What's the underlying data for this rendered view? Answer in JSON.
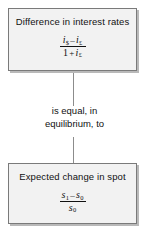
{
  "diagram": {
    "type": "flow-diagram",
    "background_color": "#ffffff",
    "box_fill_color": "#f2f2f2",
    "box_border_color": "#7a7a7a",
    "box_shadow_color": "#b9b9b9",
    "connector_color": "#8c8c8c",
    "text_color": "#111111"
  },
  "top_box": {
    "title": "Difference in interest rates",
    "formula": {
      "numerator": {
        "left_term": {
          "variable": "i",
          "subscript": "$"
        },
        "operator": "–",
        "right_term": {
          "variable": "i",
          "subscript": "£"
        }
      },
      "denominator": {
        "literal": "1",
        "operator": "+",
        "term": {
          "variable": "i",
          "subscript": "£"
        }
      }
    }
  },
  "middle_caption": {
    "line1": "is equal, in",
    "line2": "equilibrium, to"
  },
  "bottom_box": {
    "title": "Expected change in spot",
    "formula": {
      "numerator": {
        "left_term": {
          "variable": "s",
          "subscript": "1"
        },
        "operator": "–",
        "right_term": {
          "variable": "s",
          "subscript": "0"
        }
      },
      "denominator": {
        "term": {
          "variable": "s",
          "subscript": "0"
        }
      }
    }
  }
}
